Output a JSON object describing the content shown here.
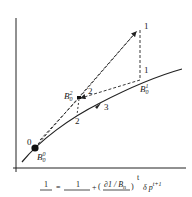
{
  "diagram": {
    "type": "iteration-convergence-sketch",
    "axes": {
      "x_label": "",
      "y_label": ""
    },
    "curve_label": "",
    "points": [
      {
        "id": "B0_0",
        "base": "B",
        "sub": "0",
        "sup": "0",
        "step_label": "0"
      },
      {
        "id": "B0_1",
        "base": "B",
        "sub": "0",
        "sup": "1",
        "step_label": "1"
      },
      {
        "id": "B0_2",
        "base": "B",
        "sub": "0",
        "sup": "2",
        "step_label": "2"
      }
    ],
    "step_labels": {
      "top_peak": "1",
      "right_vertical": "1",
      "b2_to_b1": "2",
      "b2_down": "2",
      "curve_arrow": "3",
      "start": "0"
    },
    "colors": {
      "line": "#222222",
      "background": "#ffffff"
    }
  },
  "formula": {
    "lhs_num": "1",
    "eq": "=",
    "rhs_num": "1",
    "plus": "+",
    "paren_num": "∂1 / B",
    "paren_num_sub": "n",
    "exponent": "t",
    "tail": "δ p",
    "tail_sup": "t+1"
  }
}
